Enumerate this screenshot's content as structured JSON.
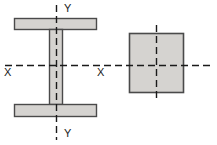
{
  "diagram": {
    "background_color": "#ffffff",
    "section_fill": "#d5d3d0",
    "section_stroke": "#4a4a4a",
    "axis_color": "#1a1a1a",
    "label_color": "#1a1a1a",
    "shapes": [
      {
        "name": "i-beam",
        "type": "i-section",
        "top_flange": {
          "x": 14,
          "y": 18,
          "width": 83,
          "height": 12
        },
        "bottom_flange": {
          "x": 14,
          "y": 104,
          "width": 83,
          "height": 13
        },
        "web": {
          "x": 49,
          "y": 30,
          "width": 14,
          "height": 74
        }
      },
      {
        "name": "square-section",
        "type": "rectangle",
        "rect": {
          "x": 129,
          "y": 33,
          "width": 55,
          "height": 60
        }
      }
    ],
    "axes": [
      {
        "name": "x-axis-main",
        "orientation": "horizontal",
        "x1": 5,
        "y1": 65,
        "x2": 212,
        "y2": 65,
        "style": "dashed"
      },
      {
        "name": "y-axis-ibeam",
        "orientation": "vertical",
        "x1": 56,
        "y1": 5,
        "x2": 56,
        "y2": 140,
        "style": "dashed"
      },
      {
        "name": "y-axis-square",
        "orientation": "vertical",
        "x1": 156,
        "y1": 25,
        "x2": 156,
        "y2": 101,
        "style": "dashed"
      }
    ],
    "labels": [
      {
        "name": "label-y-top",
        "text": "Y",
        "x": 64,
        "y": 12
      },
      {
        "name": "label-y-bottom",
        "text": "Y",
        "x": 64,
        "y": 137
      },
      {
        "name": "label-x-left",
        "text": "X",
        "x": 4,
        "y": 76
      },
      {
        "name": "label-x-middle",
        "text": "X",
        "x": 97,
        "y": 76
      }
    ]
  }
}
